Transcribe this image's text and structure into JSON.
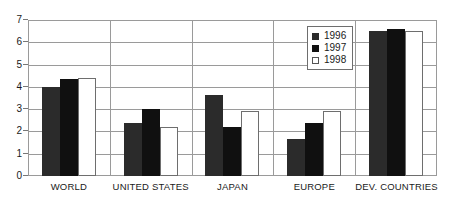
{
  "chart_data": {
    "type": "bar",
    "title": "",
    "subtitle": "",
    "xlabel": "",
    "ylabel": "",
    "ylim": [
      0,
      7
    ],
    "yticks": [
      "0",
      "1",
      "2",
      "3",
      "4",
      "5",
      "6",
      "7"
    ],
    "grid": true,
    "legend_position": "top-right",
    "categories": [
      "WORLD",
      "UNITED STATES",
      "JAPAN",
      "EUROPE",
      "DEV. COUNTRIES"
    ],
    "series": [
      {
        "name": "1996",
        "color": "#2b2b2b",
        "values": [
          4.0,
          2.4,
          3.65,
          1.65,
          6.5
        ]
      },
      {
        "name": "1997",
        "color": "#101010",
        "values": [
          4.35,
          3.0,
          2.2,
          2.4,
          6.6
        ]
      },
      {
        "name": "1998",
        "color": "#ffffff",
        "values": [
          4.4,
          2.2,
          2.9,
          2.9,
          6.5
        ]
      }
    ]
  },
  "legend": {
    "items": [
      {
        "label": "1996",
        "swatch": "filled-dark-square"
      },
      {
        "label": "1997",
        "swatch": "filled-black-square"
      },
      {
        "label": "1998",
        "swatch": "empty-white-square"
      }
    ]
  },
  "axis": {
    "y_tick_labels": [
      "7",
      "6",
      "5",
      "4",
      "3",
      "2",
      "1",
      "0"
    ],
    "x_tick_labels": [
      "WORLD",
      "UNITED STATES",
      "JAPAN",
      "EUROPE",
      "DEV. COUNTRIES"
    ]
  },
  "colors": {
    "series_1996": "#2b2b2b",
    "series_1997": "#101010",
    "series_1998": "#ffffff",
    "grid": "#9a9a9a",
    "axis": "#9a9a9a",
    "text": "#1a1a1a",
    "background": "#ffffff"
  }
}
